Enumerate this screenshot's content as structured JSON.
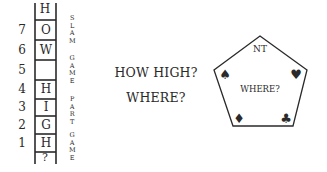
{
  "ladder": {
    "top_letter": "H",
    "bottom_label": "?",
    "rows": [
      {
        "number": "7",
        "letter": "O"
      },
      {
        "number": "6",
        "letter": "W"
      },
      {
        "number": "5",
        "letter": ""
      },
      {
        "number": "4",
        "letter": "H"
      },
      {
        "number": "3",
        "letter": "I"
      },
      {
        "number": "2",
        "letter": "G"
      },
      {
        "number": "1",
        "letter": "H"
      }
    ],
    "side_labels": [
      "SLAM",
      "GAME",
      "PART",
      "GAME"
    ]
  },
  "center": {
    "line1": "HOW HIGH?",
    "line2": "WHERE?"
  },
  "pentagon": {
    "top_label": "NT",
    "center_label": "WHERE?",
    "suits": {
      "spade": "♠",
      "heart": "♥",
      "diamond": "♦",
      "club": "♣"
    }
  }
}
